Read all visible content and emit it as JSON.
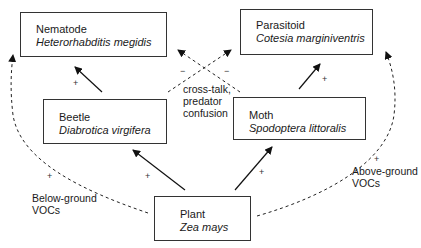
{
  "diagram": {
    "type": "interaction-network",
    "nodes": [
      {
        "id": "nematode",
        "common": "Nematode",
        "scientific": "Heterorhabditis megidis"
      },
      {
        "id": "parasitoid",
        "common": "Parasitoid",
        "scientific": "Cotesia marginiventris"
      },
      {
        "id": "beetle",
        "common": "Beetle",
        "scientific": "Diabrotica virgifera"
      },
      {
        "id": "moth",
        "common": "Moth",
        "scientific": "Spodoptera littoralis"
      },
      {
        "id": "plant",
        "common": "Plant",
        "scientific": "Zea mays"
      }
    ],
    "edges": [
      {
        "from": "beetle",
        "to": "nematode",
        "style": "solid",
        "sign": "+"
      },
      {
        "from": "moth",
        "to": "parasitoid",
        "style": "solid",
        "sign": "+"
      },
      {
        "from": "plant",
        "to": "beetle",
        "style": "solid",
        "sign": "+"
      },
      {
        "from": "plant",
        "to": "moth",
        "style": "solid",
        "sign": "+"
      },
      {
        "from": "plant",
        "to": "nematode",
        "style": "dashed",
        "sign": "+",
        "label": "Below-ground VOCs"
      },
      {
        "from": "plant",
        "to": "parasitoid",
        "style": "dashed",
        "sign": "+",
        "label": "Above-ground VOCs"
      },
      {
        "from": "beetle",
        "to": "parasitoid",
        "style": "dashed",
        "sign": "−"
      },
      {
        "from": "moth",
        "to": "nematode",
        "style": "dashed",
        "sign": "−"
      }
    ],
    "labels": {
      "below_ground_line1": "Below-ground",
      "below_ground_line2": "VOCs",
      "above_ground_line1": "Above-ground",
      "above_ground_line2": "VOCs",
      "crosstalk_line1": "cross-talk,",
      "crosstalk_line2": "predator",
      "crosstalk_line3": "confusion"
    },
    "signs": {
      "plus": "+",
      "minus": "−"
    }
  }
}
